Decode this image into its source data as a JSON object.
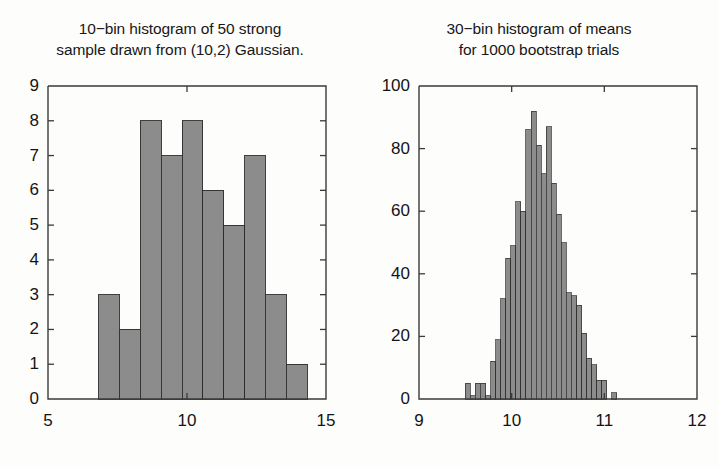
{
  "figure": {
    "background_color": "#fdfdfc",
    "bar_fill_color": "#8c8c8c",
    "bar_edge_color": "#2b2b2b",
    "axis_color": "#3a3a3a"
  },
  "panels": {
    "left": {
      "title": "10−bin histogram of 50 strong\nsample drawn from (10,2) Gaussian."
    },
    "right": {
      "title": "30−bin histogram of means\nfor 1000 bootstrap trials"
    }
  },
  "chart_data": [
    {
      "type": "bar",
      "id": "sample-histogram",
      "title": "10−bin histogram of 50 strong sample drawn from (10,2) Gaussian.",
      "xlabel": "",
      "ylabel": "",
      "xlim": [
        5,
        15
      ],
      "ylim": [
        0,
        9
      ],
      "xticks": [
        5,
        10,
        15
      ],
      "xticklabels": [
        "5",
        "10",
        "15"
      ],
      "yticks": [
        0,
        1,
        2,
        3,
        4,
        5,
        6,
        7,
        8,
        9
      ],
      "yticklabels": [
        "0",
        "1",
        "2",
        "3",
        "4",
        "5",
        "6",
        "7",
        "8",
        "9"
      ],
      "grid": false,
      "legend": null,
      "bin_edges": [
        6.82,
        7.57,
        8.32,
        9.07,
        9.82,
        10.57,
        11.32,
        12.07,
        12.82,
        13.57,
        14.32
      ],
      "bin_centers": [
        7.2,
        7.95,
        8.7,
        9.45,
        10.2,
        10.95,
        11.7,
        12.45,
        13.2,
        13.95
      ],
      "values": [
        3,
        2,
        8,
        7,
        8,
        6,
        5,
        7,
        3,
        1
      ],
      "total_count": 50
    },
    {
      "type": "bar",
      "id": "bootstrap-means-histogram",
      "title": "30−bin histogram of means for 1000 bootstrap trials",
      "xlabel": "",
      "ylabel": "",
      "xlim": [
        9,
        12
      ],
      "ylim": [
        0,
        100
      ],
      "xticks": [
        9,
        10,
        11,
        12
      ],
      "xticklabels": [
        "9",
        "10",
        "11",
        "12"
      ],
      "yticks": [
        0,
        20,
        40,
        60,
        80,
        100
      ],
      "yticklabels": [
        "0",
        "20",
        "40",
        "60",
        "80",
        "100"
      ],
      "grid": false,
      "legend": null,
      "bin_edges": [
        9.5,
        9.5545,
        9.6091,
        9.6636,
        9.7182,
        9.7727,
        9.8273,
        9.8818,
        9.9364,
        9.9909,
        10.0455,
        10.1,
        10.1545,
        10.2091,
        10.2636,
        10.3182,
        10.3727,
        10.4273,
        10.4818,
        10.5364,
        10.5909,
        10.6455,
        10.7,
        10.7545,
        10.8091,
        10.8636,
        10.9182,
        10.9727,
        11.0273,
        11.0818,
        11.1364
      ],
      "bin_centers": [
        9.527,
        9.582,
        9.636,
        9.691,
        9.745,
        9.8,
        9.855,
        9.909,
        9.964,
        10.018,
        10.073,
        10.127,
        10.182,
        10.236,
        10.291,
        10.345,
        10.4,
        10.455,
        10.509,
        10.564,
        10.618,
        10.673,
        10.727,
        10.782,
        10.836,
        10.891,
        10.945,
        11.0,
        11.055,
        11.109
      ],
      "values": [
        5,
        1,
        5,
        5,
        1,
        12,
        19,
        32,
        45,
        49,
        63,
        60,
        86,
        92,
        81,
        72,
        87,
        69,
        59,
        50,
        34,
        33,
        30,
        21,
        13,
        11,
        6,
        6,
        0,
        2
      ],
      "total_count": 1000
    }
  ]
}
